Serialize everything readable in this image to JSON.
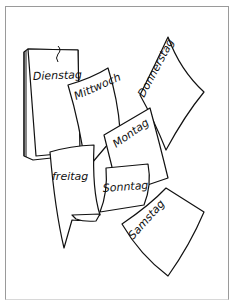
{
  "illustration": {
    "title": "Wochentage",
    "pages": [
      {
        "id": "dienstag",
        "label": "Dienstag"
      },
      {
        "id": "mittwoch",
        "label": "Mittwoch"
      },
      {
        "id": "donnerstag",
        "label": "Donnerstag"
      },
      {
        "id": "montag",
        "label": "Montag"
      },
      {
        "id": "freitag",
        "label": "freitag"
      },
      {
        "id": "sonntag",
        "label": "Sonntag"
      },
      {
        "id": "samstag",
        "label": "Samstag"
      }
    ]
  }
}
